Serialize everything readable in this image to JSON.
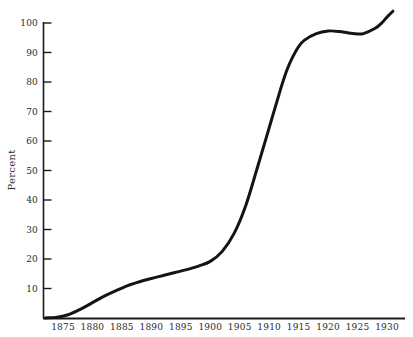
{
  "chart_data": {
    "type": "line",
    "title": "",
    "subtitle": "",
    "xlabel": "",
    "ylabel": "Percent",
    "xlim": [
      1872,
      1931
    ],
    "ylim": [
      0,
      104
    ],
    "grid": false,
    "legend": "none",
    "x_ticks": [
      1875,
      1880,
      1885,
      1890,
      1895,
      1900,
      1905,
      1910,
      1915,
      1920,
      1925,
      1930
    ],
    "x_tick_labels": [
      "1875",
      "1880",
      "1885",
      "1890",
      "1895",
      "1900",
      "1905",
      "1910",
      "1915",
      "1920",
      "1925",
      "1930"
    ],
    "y_ticks": [
      10,
      20,
      30,
      40,
      50,
      60,
      70,
      80,
      90,
      100
    ],
    "y_tick_labels": [
      "10",
      "20",
      "30",
      "40",
      "50",
      "60",
      "70",
      "80",
      "90",
      "100"
    ],
    "series": [
      {
        "name": "Percent",
        "color": "#141414",
        "line_width": 3,
        "x": [
          1872,
          1874,
          1876,
          1878,
          1880,
          1882,
          1884,
          1886,
          1888,
          1890,
          1892,
          1894,
          1896,
          1898,
          1900,
          1902,
          1904,
          1906,
          1908,
          1910,
          1912,
          1913,
          1914,
          1915,
          1916,
          1918,
          1920,
          1922,
          1924,
          1925,
          1926,
          1928,
          1929,
          1930,
          1931
        ],
        "y": [
          0.0,
          0.3,
          1.2,
          3.0,
          5.2,
          7.4,
          9.3,
          11.0,
          12.3,
          13.4,
          14.4,
          15.4,
          16.4,
          17.6,
          19.2,
          22.5,
          28.5,
          38.0,
          51.0,
          64.5,
          78.0,
          84.0,
          88.5,
          92.0,
          94.2,
          96.4,
          97.3,
          97.1,
          96.5,
          96.3,
          96.4,
          98.2,
          99.8,
          102.0,
          104.0
        ]
      }
    ]
  },
  "axes": {
    "y_axis_title": "Percent",
    "axis_color": "#1a1a1a"
  }
}
